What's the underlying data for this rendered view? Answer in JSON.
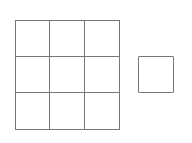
{
  "diagram": {
    "grid": {
      "rows": 3,
      "cols": 3,
      "cells": [
        {
          "row": 1,
          "col": 1
        },
        {
          "row": 1,
          "col": 2
        },
        {
          "row": 1,
          "col": 3
        },
        {
          "row": 2,
          "col": 1
        },
        {
          "row": 2,
          "col": 2
        },
        {
          "row": 2,
          "col": 3
        },
        {
          "row": 3,
          "col": 1
        },
        {
          "row": 3,
          "col": 2
        },
        {
          "row": 3,
          "col": 3
        }
      ]
    },
    "single_square": {
      "count": 1
    },
    "colors": {
      "stroke": "#777777",
      "background": "#ffffff"
    }
  }
}
